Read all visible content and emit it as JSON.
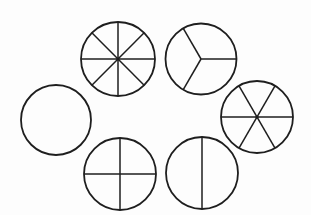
{
  "diagram": {
    "width": 311,
    "height": 215,
    "stroke_color": "#1e1e1e",
    "background": "#fdfdfd",
    "circles": [
      {
        "id": "whole",
        "parts": 1,
        "cx": 56,
        "cy": 120,
        "r": 35,
        "start_angle_deg": 0,
        "center_dot": false
      },
      {
        "id": "eighths",
        "parts": 8,
        "cx": 118,
        "cy": 59,
        "r": 37,
        "start_angle_deg": 0,
        "center_dot": true
      },
      {
        "id": "thirds",
        "parts": 3,
        "cx": 201,
        "cy": 59,
        "r": 35.5,
        "start_angle_deg": 0,
        "center_dot": false
      },
      {
        "id": "sixths",
        "parts": 6,
        "cx": 257,
        "cy": 117,
        "r": 36,
        "start_angle_deg": 0,
        "center_dot": true
      },
      {
        "id": "fourths",
        "parts": 4,
        "cx": 120,
        "cy": 174,
        "r": 36,
        "start_angle_deg": 0,
        "center_dot": false
      },
      {
        "id": "halves",
        "parts": 2,
        "cx": 202,
        "cy": 173,
        "r": 36,
        "start_angle_deg": 90,
        "center_dot": false
      }
    ]
  }
}
